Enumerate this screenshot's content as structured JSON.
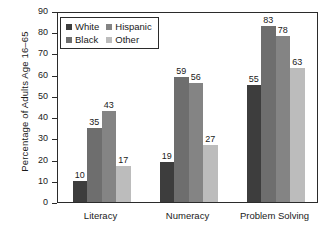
{
  "chart_data": {
    "type": "bar",
    "title": "",
    "subtitle": "",
    "xlabel": "",
    "ylabel": "Percentage of Adults Age 16–65",
    "ylim": [
      0,
      90
    ],
    "ytick_step": 10,
    "yticks": [
      0,
      10,
      20,
      30,
      40,
      50,
      60,
      70,
      80,
      90
    ],
    "ytick_labels": [
      "0",
      "10",
      "20",
      "30",
      "40",
      "50",
      "60",
      "70",
      "80",
      "90"
    ],
    "grid": false,
    "legend_position": "upper-left-inside",
    "categories": [
      "Literacy",
      "Numeracy",
      "Problem Solving"
    ],
    "series": [
      {
        "name": "White",
        "color": "#3d3d3d",
        "values": [
          10,
          19,
          55
        ]
      },
      {
        "name": "Black",
        "color": "#6e6e6e",
        "values": [
          35,
          59,
          83
        ]
      },
      {
        "name": "Hispanic",
        "color": "#848484",
        "values": [
          43,
          56,
          78
        ]
      },
      {
        "name": "Other",
        "color": "#bcbcbc",
        "values": [
          17,
          27,
          63
        ]
      }
    ],
    "legend_entries": [
      {
        "label": "White",
        "color": "#3d3d3d"
      },
      {
        "label": "Hispanic",
        "color": "#848484"
      },
      {
        "label": "Black",
        "color": "#6e6e6e"
      },
      {
        "label": "Other",
        "color": "#bcbcbc"
      }
    ],
    "data_labels": [
      {
        "category": "Literacy",
        "series": "White",
        "value": 10
      },
      {
        "category": "Literacy",
        "series": "Black",
        "value": 35
      },
      {
        "category": "Literacy",
        "series": "Hispanic",
        "value": 43
      },
      {
        "category": "Literacy",
        "series": "Other",
        "value": 17
      },
      {
        "category": "Numeracy",
        "series": "White",
        "value": 19
      },
      {
        "category": "Numeracy",
        "series": "Black",
        "value": 59
      },
      {
        "category": "Numeracy",
        "series": "Hispanic",
        "value": 56
      },
      {
        "category": "Numeracy",
        "series": "Other",
        "value": 27
      },
      {
        "category": "Problem Solving",
        "series": "White",
        "value": 55
      },
      {
        "category": "Problem Solving",
        "series": "Black",
        "value": 83
      },
      {
        "category": "Problem Solving",
        "series": "Hispanic",
        "value": 78
      },
      {
        "category": "Problem Solving",
        "series": "Other",
        "value": 63
      }
    ],
    "axis_color": "#2b2b2b",
    "background_color": "#ffffff"
  }
}
